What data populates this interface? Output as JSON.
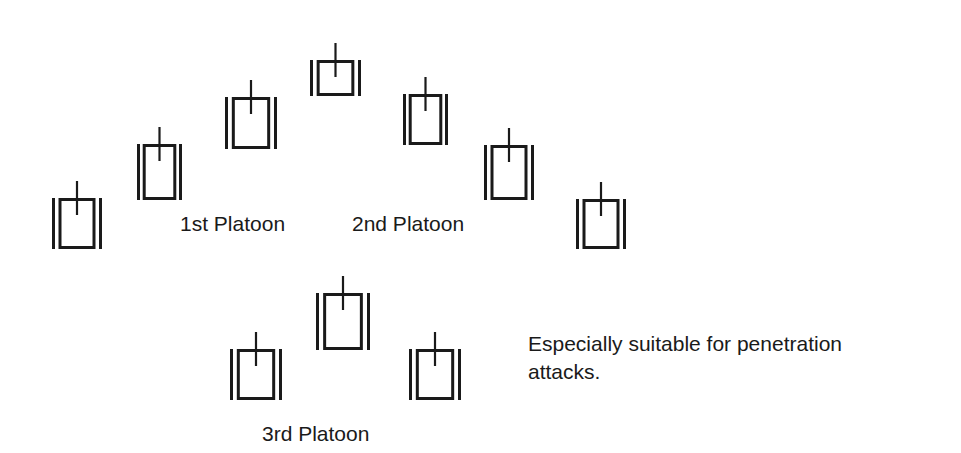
{
  "diagram": {
    "type": "formation",
    "colors": {
      "ink": "#1a1a1a",
      "background": "#ffffff"
    },
    "tanks": [
      {
        "id": "t1",
        "group": "1st Platoon",
        "x": 52,
        "y": 181,
        "w": 50,
        "h": 68
      },
      {
        "id": "t2",
        "group": "1st Platoon",
        "x": 137,
        "y": 127,
        "w": 45,
        "h": 73
      },
      {
        "id": "t3",
        "group": "1st Platoon",
        "x": 225,
        "y": 80,
        "w": 52,
        "h": 69
      },
      {
        "id": "t4",
        "group": "center",
        "x": 310,
        "y": 43,
        "w": 51,
        "h": 53
      },
      {
        "id": "t5",
        "group": "2nd Platoon",
        "x": 403,
        "y": 77,
        "w": 45,
        "h": 68
      },
      {
        "id": "t6",
        "group": "2nd Platoon",
        "x": 484,
        "y": 128,
        "w": 50,
        "h": 72
      },
      {
        "id": "t7",
        "group": "2nd Platoon",
        "x": 576,
        "y": 182,
        "w": 50,
        "h": 67
      },
      {
        "id": "t8",
        "group": "3rd Platoon",
        "x": 230,
        "y": 332,
        "w": 52,
        "h": 68
      },
      {
        "id": "t9",
        "group": "3rd Platoon",
        "x": 316,
        "y": 276,
        "w": 54,
        "h": 74
      },
      {
        "id": "t10",
        "group": "3rd Platoon",
        "x": 409,
        "y": 332,
        "w": 52,
        "h": 68
      }
    ],
    "labels": {
      "platoon1": "1st Platoon",
      "platoon2": "2nd Platoon",
      "platoon3": "3rd Platoon"
    },
    "note_line1": "Especially suitable for penetration",
    "note_line2": "attacks."
  }
}
